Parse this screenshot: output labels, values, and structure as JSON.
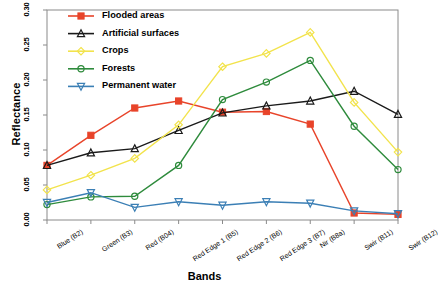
{
  "chart_data": {
    "type": "line",
    "title": "",
    "xlabel": "Bands",
    "ylabel": "Reflectance",
    "ylim": [
      0.0,
      0.3
    ],
    "yticks": [
      "0.00",
      "0.05",
      "0.10",
      "0.15",
      "0.20",
      "0.25",
      "0.30"
    ],
    "grid": false,
    "legend_position": "top-left",
    "categories": [
      "Blue (B2)",
      "Green (B3)",
      "Red (B04)",
      "Red Edge 1 (B5)",
      "Red Edge 2 (B6)",
      "Red Edge 3 (B7)",
      "Nir (B8a)",
      "Swir (B11)",
      "Swir (B12)"
    ],
    "series": [
      {
        "name": "Flooded areas",
        "color": "#E8442A",
        "marker": "square",
        "values": [
          0.078,
          0.121,
          0.16,
          0.17,
          0.154,
          0.155,
          0.137,
          0.01,
          0.008
        ]
      },
      {
        "name": "Artificial surfaces",
        "color": "#1A1A1A",
        "marker": "triangle",
        "values": [
          0.078,
          0.096,
          0.102,
          0.128,
          0.153,
          0.163,
          0.17,
          0.184,
          0.151
        ]
      },
      {
        "name": "Crops",
        "color": "#F2E34C",
        "marker": "diamond",
        "values": [
          0.043,
          0.064,
          0.088,
          0.136,
          0.219,
          0.238,
          0.268,
          0.168,
          0.097
        ]
      },
      {
        "name": "Forests",
        "color": "#2E8B3C",
        "marker": "circle",
        "values": [
          0.022,
          0.033,
          0.034,
          0.078,
          0.172,
          0.197,
          0.228,
          0.134,
          0.072
        ]
      },
      {
        "name": "Permanent water",
        "color": "#3B7FB5",
        "marker": "triangle-down",
        "values": [
          0.025,
          0.039,
          0.018,
          0.026,
          0.021,
          0.026,
          0.024,
          0.013,
          0.009
        ]
      }
    ]
  },
  "axis": {
    "y_title": "Reflectance",
    "x_title": "Bands"
  }
}
